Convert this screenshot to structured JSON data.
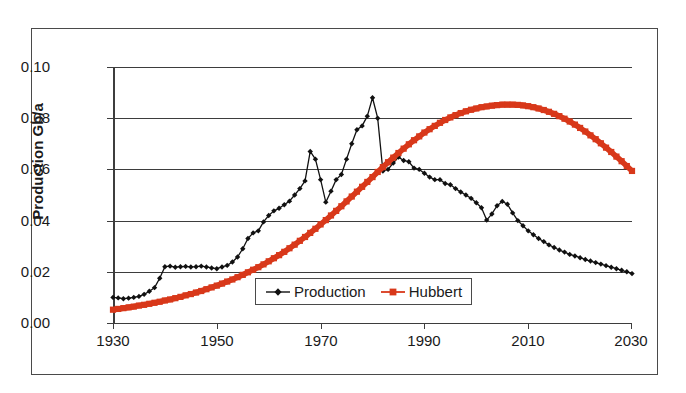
{
  "chart_data": {
    "type": "line",
    "title": "",
    "xlabel": "",
    "ylabel": "Production Gb/a",
    "xlim": [
      1930,
      2030
    ],
    "ylim": [
      0.0,
      0.1
    ],
    "xticks": [
      1930,
      1950,
      1970,
      1990,
      2010,
      2030
    ],
    "ytick_labels": [
      "0.10",
      "0.08",
      "0.06",
      "0.04",
      "0.02",
      "0.00"
    ],
    "yticks": [
      0.1,
      0.08,
      0.06,
      0.04,
      0.02,
      0.0
    ],
    "grid": "horizontal",
    "legend_position": "inside-bottom-center",
    "series": [
      {
        "name": "Production",
        "color": "#111111",
        "marker": "diamond",
        "x": [
          1930,
          1931,
          1932,
          1933,
          1934,
          1935,
          1936,
          1937,
          1938,
          1939,
          1940,
          1941,
          1942,
          1943,
          1944,
          1945,
          1946,
          1947,
          1948,
          1949,
          1950,
          1951,
          1952,
          1953,
          1954,
          1955,
          1956,
          1957,
          1958,
          1959,
          1960,
          1961,
          1962,
          1963,
          1964,
          1965,
          1966,
          1967,
          1968,
          1969,
          1970,
          1971,
          1972,
          1973,
          1974,
          1975,
          1976,
          1977,
          1978,
          1979,
          1980,
          1981,
          1982,
          1983,
          1984,
          1985,
          1986,
          1987,
          1988,
          1989,
          1990,
          1991,
          1992,
          1993,
          1994,
          1995,
          1996,
          1997,
          1998,
          1999,
          2000,
          2001,
          2002,
          2003,
          2004,
          2005,
          2006,
          2007,
          2008,
          2009,
          2010,
          2011,
          2012,
          2013,
          2014,
          2015,
          2016,
          2017,
          2018,
          2019,
          2020,
          2021,
          2022,
          2023,
          2024,
          2025,
          2026,
          2027,
          2028,
          2029,
          2030
        ],
        "y": [
          0.01,
          0.0098,
          0.0095,
          0.0097,
          0.01,
          0.0104,
          0.0112,
          0.0124,
          0.0138,
          0.0175,
          0.022,
          0.0222,
          0.0218,
          0.022,
          0.0221,
          0.0219,
          0.022,
          0.0222,
          0.0219,
          0.0215,
          0.0212,
          0.0219,
          0.0225,
          0.0238,
          0.0258,
          0.029,
          0.033,
          0.0352,
          0.036,
          0.0395,
          0.042,
          0.0438,
          0.0448,
          0.0462,
          0.0476,
          0.05,
          0.0525,
          0.0555,
          0.067,
          0.064,
          0.056,
          0.0472,
          0.0515,
          0.056,
          0.058,
          0.064,
          0.07,
          0.0755,
          0.077,
          0.0808,
          0.088,
          0.08,
          0.0594,
          0.06,
          0.0625,
          0.0648,
          0.0635,
          0.063,
          0.0605,
          0.06,
          0.0585,
          0.057,
          0.056,
          0.056,
          0.0545,
          0.054,
          0.0525,
          0.0512,
          0.05,
          0.0487,
          0.047,
          0.045,
          0.0402,
          0.0426,
          0.0458,
          0.0475,
          0.0464,
          0.043,
          0.04,
          0.038,
          0.036,
          0.0345,
          0.033,
          0.0318,
          0.0305,
          0.0295,
          0.0285,
          0.0277,
          0.0268,
          0.0262,
          0.0255,
          0.0248,
          0.0242,
          0.0236,
          0.023,
          0.0224,
          0.0218,
          0.0212,
          0.0206,
          0.02,
          0.0193
        ]
      },
      {
        "name": "Hubbert",
        "color": "#D8381A",
        "marker": "square",
        "x": [
          1930,
          1931,
          1932,
          1933,
          1934,
          1935,
          1936,
          1937,
          1938,
          1939,
          1940,
          1941,
          1942,
          1943,
          1944,
          1945,
          1946,
          1947,
          1948,
          1949,
          1950,
          1951,
          1952,
          1953,
          1954,
          1955,
          1956,
          1957,
          1958,
          1959,
          1960,
          1961,
          1962,
          1963,
          1964,
          1965,
          1966,
          1967,
          1968,
          1969,
          1970,
          1971,
          1972,
          1973,
          1974,
          1975,
          1976,
          1977,
          1978,
          1979,
          1980,
          1981,
          1982,
          1983,
          1984,
          1985,
          1986,
          1987,
          1988,
          1989,
          1990,
          1991,
          1992,
          1993,
          1994,
          1995,
          1996,
          1997,
          1998,
          1999,
          2000,
          2001,
          2002,
          2003,
          2004,
          2005,
          2006,
          2007,
          2008,
          2009,
          2010,
          2011,
          2012,
          2013,
          2014,
          2015,
          2016,
          2017,
          2018,
          2019,
          2020,
          2021,
          2022,
          2023,
          2024,
          2025,
          2026,
          2027,
          2028,
          2029,
          2030
        ],
        "y": [
          0.0052,
          0.0055,
          0.0058,
          0.0061,
          0.0064,
          0.0068,
          0.0071,
          0.0075,
          0.0079,
          0.0083,
          0.0088,
          0.0092,
          0.0097,
          0.0102,
          0.0108,
          0.0113,
          0.0119,
          0.0125,
          0.0132,
          0.0139,
          0.0146,
          0.0154,
          0.0162,
          0.017,
          0.0179,
          0.0188,
          0.0198,
          0.0208,
          0.0218,
          0.0229,
          0.0241,
          0.0253,
          0.0265,
          0.0278,
          0.0292,
          0.0306,
          0.0321,
          0.0336,
          0.0352,
          0.0368,
          0.0385,
          0.0402,
          0.042,
          0.0438,
          0.0456,
          0.0475,
          0.0494,
          0.0513,
          0.0532,
          0.0551,
          0.057,
          0.059,
          0.0609,
          0.0628,
          0.0646,
          0.0664,
          0.0681,
          0.0698,
          0.0714,
          0.0729,
          0.0744,
          0.0757,
          0.077,
          0.0782,
          0.0793,
          0.0803,
          0.0812,
          0.082,
          0.0827,
          0.0833,
          0.0838,
          0.0843,
          0.0846,
          0.0849,
          0.0851,
          0.0853,
          0.0853,
          0.0853,
          0.0852,
          0.085,
          0.0847,
          0.0843,
          0.0838,
          0.0832,
          0.0825,
          0.0817,
          0.0808,
          0.0798,
          0.0787,
          0.0775,
          0.0762,
          0.0748,
          0.0733,
          0.0718,
          0.0702,
          0.0685,
          0.0668,
          0.065,
          0.0632,
          0.0613,
          0.0594
        ]
      }
    ]
  },
  "axis": {
    "y_title": "Production Gb/a",
    "y_tick_labels": [
      "0.10",
      "0.08",
      "0.06",
      "0.04",
      "0.02",
      "0.00"
    ],
    "x_tick_labels": [
      "1930",
      "1950",
      "1970",
      "1990",
      "2010",
      "2030"
    ]
  },
  "legend": {
    "entries": [
      {
        "label": "Production",
        "color": "#111111",
        "marker": "diamond"
      },
      {
        "label": "Hubbert",
        "color": "#D8381A",
        "marker": "square"
      }
    ]
  },
  "colors": {
    "production": "#111111",
    "hubbert": "#D8381A",
    "grid": "#3d3d3d",
    "frame": "#4a4a4a",
    "text": "#1a1a1a"
  }
}
